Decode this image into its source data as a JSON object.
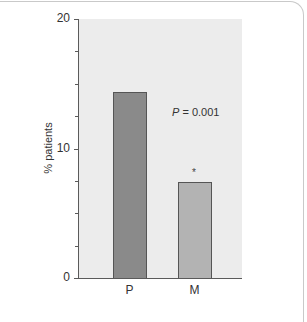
{
  "chart_data": {
    "type": "bar",
    "title": "",
    "xlabel": "",
    "ylabel": "% patients",
    "ylim": [
      0,
      20
    ],
    "yticks": [
      0,
      10,
      20
    ],
    "ytick_labels": [
      "0",
      "10",
      "20"
    ],
    "minor_ticks": [
      2.5,
      5,
      7.5,
      12.5,
      15,
      17.5
    ],
    "categories": [
      "P",
      "M"
    ],
    "values": [
      14.4,
      7.4
    ],
    "bar_colors": [
      "#8a8a8a",
      "#b3b3b3"
    ],
    "annotations": [
      {
        "text": "P = 0.001",
        "italic_prefix": "P",
        "rest": " = 0.001"
      },
      {
        "text": "*",
        "target": "M"
      }
    ],
    "grid": false,
    "legend": null,
    "plot_background": "#ececec"
  }
}
